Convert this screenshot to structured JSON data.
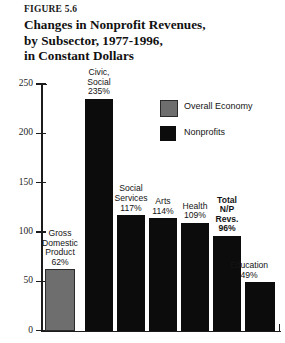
{
  "figure": {
    "number": "FIGURE 5.6",
    "title_lines": [
      "Changes in Nonprofit Revenues,",
      "by Subsector, 1977-1996,",
      "in Constant Dollars"
    ]
  },
  "legend": {
    "position": "inside-top-right",
    "items": [
      {
        "label": "Overall Economy",
        "color": "#6e6e6e",
        "key": "overall-economy"
      },
      {
        "label": "Nonprofits",
        "color": "#0c0c0c",
        "key": "nonprofits"
      }
    ]
  },
  "axis": {
    "y_ticks": [
      "0",
      "50",
      "100",
      "150",
      "200",
      "250"
    ]
  },
  "chart_data": {
    "type": "bar",
    "title": "Changes in Nonprofit Revenues, by Subsector, 1977-1996, in Constant Dollars",
    "subtitle": "FIGURE 5.6",
    "xlabel": "",
    "ylabel": "",
    "ylim": [
      0,
      250
    ],
    "yticks": [
      0,
      50,
      100,
      150,
      200,
      250
    ],
    "grid": false,
    "legend": [
      "Overall Economy",
      "Nonprofits"
    ],
    "categories": [
      "Gross Domestic Product",
      "Civic, Social",
      "Social Services",
      "Arts",
      "Health",
      "Total N/P Revs.",
      "Education"
    ],
    "values": [
      62,
      235,
      117,
      114,
      109,
      96,
      49
    ],
    "value_labels": [
      "62%",
      "235%",
      "117%",
      "114%",
      "109%",
      "96%",
      "49%"
    ],
    "series_of_bar": [
      "Overall Economy",
      "Nonprofits",
      "Nonprofits",
      "Nonprofits",
      "Nonprofits",
      "Nonprofits",
      "Nonprofits"
    ]
  },
  "bars": [
    {
      "key": "gross-domestic-product",
      "label_lines": [
        "Gross",
        "Domestic",
        "Product",
        "62%"
      ],
      "value": 62,
      "series": "Overall Economy",
      "bold": false
    },
    {
      "key": "civic-social",
      "label_lines": [
        "Civic,",
        "Social",
        "235%"
      ],
      "value": 235,
      "series": "Nonprofits",
      "bold": false
    },
    {
      "key": "social-services",
      "label_lines": [
        "Social",
        "Services",
        "117%"
      ],
      "value": 117,
      "series": "Nonprofits",
      "bold": false
    },
    {
      "key": "arts",
      "label_lines": [
        "Arts",
        "114%"
      ],
      "value": 114,
      "series": "Nonprofits",
      "bold": false
    },
    {
      "key": "health",
      "label_lines": [
        "Health",
        "109%"
      ],
      "value": 109,
      "series": "Nonprofits",
      "bold": false
    },
    {
      "key": "total-np-revs",
      "label_lines": [
        "Total",
        "N/P",
        "Revs.",
        "96%"
      ],
      "value": 96,
      "series": "Nonprofits",
      "bold": true
    },
    {
      "key": "education",
      "label_lines": [
        "Education",
        "49%"
      ],
      "value": 49,
      "series": "Nonprofits",
      "bold": false
    }
  ]
}
